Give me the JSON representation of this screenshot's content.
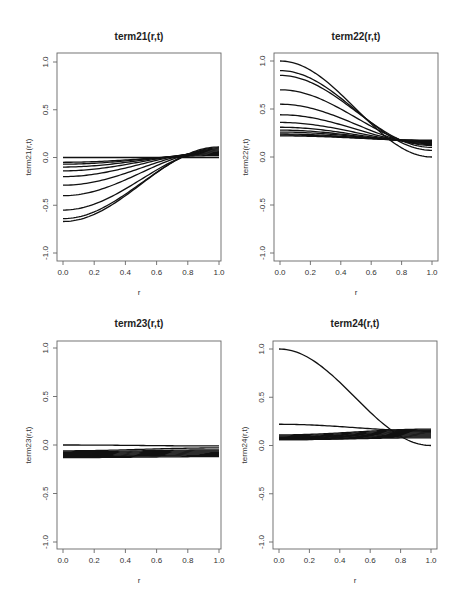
{
  "chart_data": [
    {
      "type": "line",
      "title": "term21(r,t)",
      "xlabel": "r",
      "ylabel": "term21(r,t)",
      "xlim": [
        0,
        1
      ],
      "ylim": [
        -1,
        1
      ],
      "xticks": [
        "0.0",
        "0.2",
        "0.4",
        "0.6",
        "0.8",
        "1.0"
      ],
      "yticks": [
        "-1.0",
        "-0.5",
        "0.0",
        "0.5",
        "1.0"
      ],
      "grid": false,
      "crossing_point": {
        "r": 0.68,
        "value": 0.0
      },
      "series": [
        {
          "start": 0.0,
          "end": 0.0
        },
        {
          "start": -0.05,
          "end": 0.02
        },
        {
          "start": -0.07,
          "end": 0.03
        },
        {
          "start": -0.1,
          "end": 0.04
        },
        {
          "start": -0.14,
          "end": 0.05
        },
        {
          "start": -0.2,
          "end": 0.06
        },
        {
          "start": -0.29,
          "end": 0.07
        },
        {
          "start": -0.4,
          "end": 0.08
        },
        {
          "start": -0.55,
          "end": 0.09
        },
        {
          "start": -0.64,
          "end": 0.1
        },
        {
          "start": -0.67,
          "end": 0.11
        }
      ]
    },
    {
      "type": "line",
      "title": "term22(r,t)",
      "xlabel": "r",
      "ylabel": "term22(r,t)",
      "xlim": [
        0,
        1
      ],
      "ylim": [
        -1,
        1
      ],
      "xticks": [
        "0.0",
        "0.2",
        "0.4",
        "0.6",
        "0.8",
        "1.0"
      ],
      "yticks": [
        "-1.0",
        "-0.5",
        "0.0",
        "0.5",
        "1.0"
      ],
      "grid": false,
      "crossing_point": {
        "r": 0.72,
        "value": 0.18
      },
      "series": [
        {
          "start": 1.0,
          "end": 0.0
        },
        {
          "start": 0.9,
          "end": 0.07
        },
        {
          "start": 0.85,
          "end": 0.1
        },
        {
          "start": 0.7,
          "end": 0.12
        },
        {
          "start": 0.55,
          "end": 0.13
        },
        {
          "start": 0.44,
          "end": 0.14
        },
        {
          "start": 0.36,
          "end": 0.15
        },
        {
          "start": 0.31,
          "end": 0.155
        },
        {
          "start": 0.28,
          "end": 0.16
        },
        {
          "start": 0.26,
          "end": 0.165
        },
        {
          "start": 0.24,
          "end": 0.17
        },
        {
          "start": 0.23,
          "end": 0.17
        },
        {
          "start": 0.22,
          "end": 0.175
        }
      ]
    },
    {
      "type": "line",
      "title": "term23(r,t)",
      "xlabel": "r",
      "ylabel": "term23(r,t)",
      "xlim": [
        0,
        1
      ],
      "ylim": [
        -1,
        1
      ],
      "xticks": [
        "0.0",
        "0.2",
        "0.4",
        "0.6",
        "0.8",
        "1.0"
      ],
      "yticks": [
        "-1.0",
        "-0.5",
        "0.0",
        "0.5",
        "1.0"
      ],
      "grid": false,
      "series": [
        {
          "start": 0.0,
          "end": -0.01
        },
        {
          "start": -0.06,
          "end": -0.03
        },
        {
          "start": -0.07,
          "end": -0.05
        },
        {
          "start": -0.08,
          "end": -0.06
        },
        {
          "start": -0.09,
          "end": -0.07
        },
        {
          "start": -0.1,
          "end": -0.08
        },
        {
          "start": -0.11,
          "end": -0.09
        },
        {
          "start": -0.12,
          "end": -0.1
        },
        {
          "start": -0.12,
          "end": -0.11
        },
        {
          "start": -0.13,
          "end": -0.12
        }
      ]
    },
    {
      "type": "line",
      "title": "term24(r,t)",
      "xlabel": "r",
      "ylabel": "term24(r,t)",
      "xlim": [
        0,
        1
      ],
      "ylim": [
        -1,
        1
      ],
      "xticks": [
        "0.0",
        "0.2",
        "0.4",
        "0.6",
        "0.8",
        "1.0"
      ],
      "yticks": [
        "-1.0",
        "-0.5",
        "0.0",
        "0.5",
        "1.0"
      ],
      "grid": false,
      "series": [
        {
          "start": 1.0,
          "end": 0.0
        },
        {
          "start": 0.22,
          "end": 0.15
        },
        {
          "start": 0.11,
          "end": 0.17
        },
        {
          "start": 0.1,
          "end": 0.16
        },
        {
          "start": 0.09,
          "end": 0.15
        },
        {
          "start": 0.085,
          "end": 0.14
        },
        {
          "start": 0.08,
          "end": 0.13
        },
        {
          "start": 0.075,
          "end": 0.12
        },
        {
          "start": 0.07,
          "end": 0.11
        },
        {
          "start": 0.065,
          "end": 0.1
        },
        {
          "start": 0.06,
          "end": 0.09
        },
        {
          "start": 0.06,
          "end": 0.08
        }
      ]
    }
  ],
  "panels": [
    {
      "title": "term21(r,t)",
      "xlabel": "r",
      "ylabel": "term21(r,t)"
    },
    {
      "title": "term22(r,t)",
      "xlabel": "r",
      "ylabel": "term22(r,t)"
    },
    {
      "title": "term23(r,t)",
      "xlabel": "r",
      "ylabel": "term23(r,t)"
    },
    {
      "title": "term24(r,t)",
      "xlabel": "r",
      "ylabel": "term24(r,t)"
    }
  ],
  "colors": {
    "line": "#111111",
    "axis": "#666666",
    "background": "#ffffff"
  }
}
